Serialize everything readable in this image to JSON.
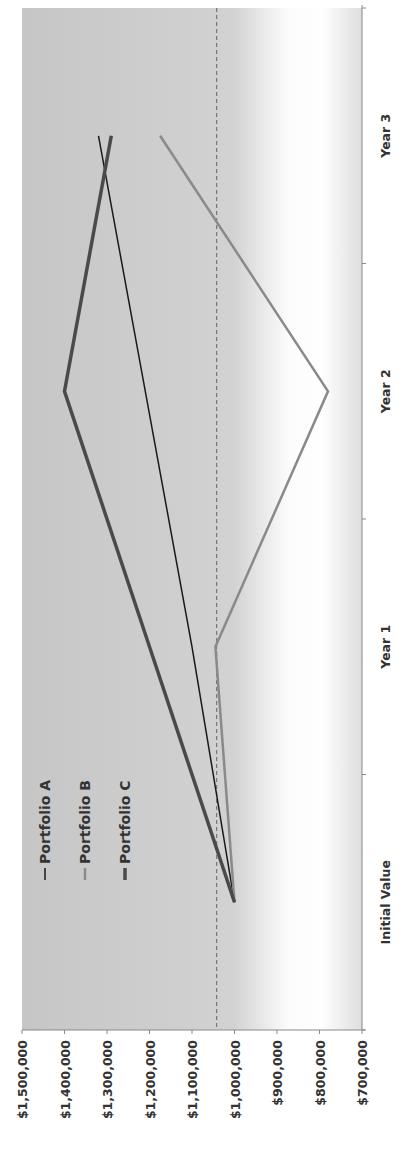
{
  "chart_data": {
    "type": "line",
    "title": "",
    "xlabel": "",
    "ylabel": "",
    "orientation_note": "rotated 90 degrees counter-clockwise",
    "categories": [
      "Initial Value",
      "Year 1",
      "Year 2",
      "Year 3"
    ],
    "series": [
      {
        "name": "Portfolio A",
        "values": [
          1000000,
          1100000,
          1210000,
          1320000
        ],
        "color": "#1a1a1a",
        "weight": "thin"
      },
      {
        "name": "Portfolio B",
        "values": [
          1000000,
          1045000,
          780000,
          1175000
        ],
        "color": "#8a8a8a",
        "weight": "medium"
      },
      {
        "name": "Portfolio C",
        "values": [
          1000000,
          1200000,
          1400000,
          1290000
        ],
        "color": "#4a4a4a",
        "weight": "thick"
      }
    ],
    "reference_line": {
      "value": 1042000,
      "style": "dashed",
      "color": "#777777"
    },
    "ylim": [
      700000,
      1500000
    ],
    "yticks": [
      1500000,
      1400000,
      1300000,
      1200000,
      1100000,
      1000000,
      900000,
      800000,
      700000
    ],
    "ytick_labels": [
      "$1,500,000",
      "$1,400,000",
      "$1,300,000",
      "$1,200,000",
      "$1,100,000",
      "$1,000,000",
      "$900,000",
      "$800,000",
      "$700,000"
    ],
    "grid": false,
    "legend": "top-left",
    "background": {
      "plot_fill": "#c9c9c9",
      "fade_to": "#ffffff"
    }
  }
}
